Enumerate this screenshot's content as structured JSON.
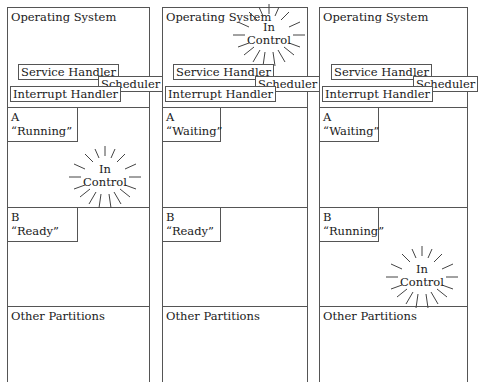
{
  "diagram": {
    "title": "",
    "line_color": "#555555",
    "columns": [
      {
        "os": {
          "title": "Operating System",
          "service_handler": "Service Handler",
          "scheduler": "Scheduler",
          "interrupt_handler": "Interrupt Handler"
        },
        "process_a": {
          "name": "A",
          "state": "“Running”"
        },
        "process_b": {
          "name": "B",
          "state": "“Ready”"
        },
        "other": "Other Partitions",
        "in_control": {
          "line1": "In",
          "line2": "Control",
          "location": "process_a"
        }
      },
      {
        "os": {
          "title": "Operating System",
          "service_handler": "Service Handler",
          "scheduler": "Scheduler",
          "interrupt_handler": "Interrupt Handler"
        },
        "process_a": {
          "name": "A",
          "state": "“Waiting”"
        },
        "process_b": {
          "name": "B",
          "state": "“Ready”"
        },
        "other": "Other Partitions",
        "in_control": {
          "line1": "In",
          "line2": "Control",
          "location": "os"
        }
      },
      {
        "os": {
          "title": "Operating System",
          "service_handler": "Service Handler",
          "scheduler": "Scheduler",
          "interrupt_handler": "Interrupt Handler"
        },
        "process_a": {
          "name": "A",
          "state": "“Waiting”"
        },
        "process_b": {
          "name": "B",
          "state": "“Running”"
        },
        "other": "Other Partitions",
        "in_control": {
          "line1": "In",
          "line2": "Control",
          "location": "process_b"
        }
      }
    ]
  }
}
